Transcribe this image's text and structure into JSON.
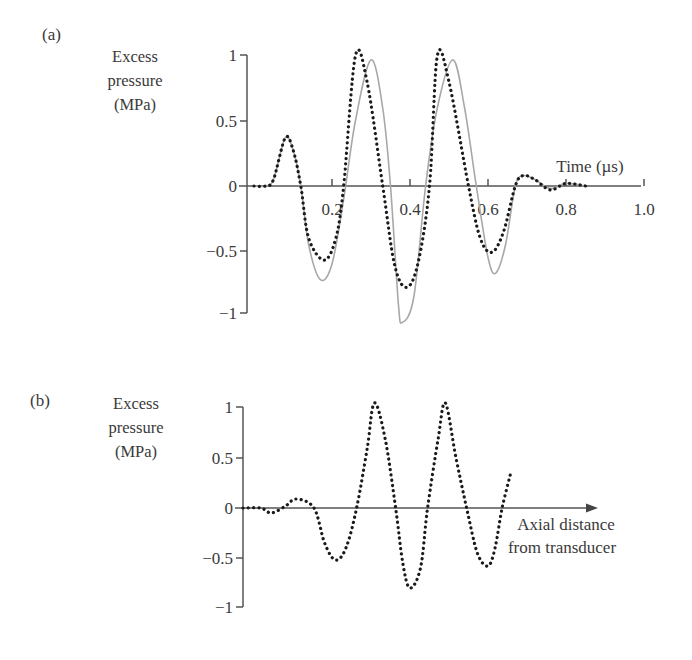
{
  "chart_data": [
    {
      "panel": "(a)",
      "type": "line",
      "ylabel": [
        "Excess",
        "pressure",
        "(MPa)"
      ],
      "xlabel": "Time (µs)",
      "xlim": [
        0,
        1.0
      ],
      "ylim": [
        -1,
        1
      ],
      "xticks": [
        0.2,
        0.4,
        0.6,
        0.8,
        1.0
      ],
      "xtick_labels": [
        "0.2",
        "0.4",
        "0.6",
        "0.8",
        "1.0"
      ],
      "yticks": [
        1,
        0.5,
        0,
        -0.5,
        -1
      ],
      "ytick_labels": [
        "1",
        "0.5",
        "0",
        "−0.5",
        "−1"
      ],
      "grid": false,
      "series": [
        {
          "name": "solid-gray",
          "style": "solid",
          "color": "#a8a8a8",
          "x": [
            0,
            0.03,
            0.05,
            0.08,
            0.1,
            0.12,
            0.14,
            0.17,
            0.2,
            0.23,
            0.26,
            0.3,
            0.33,
            0.35,
            0.37,
            0.38,
            0.41,
            0.44,
            0.47,
            0.51,
            0.54,
            0.57,
            0.6,
            0.62,
            0.645,
            0.67,
            0.69,
            0.72,
            0.76,
            0.8,
            0.85
          ],
          "y": [
            0,
            0,
            0.05,
            0.37,
            0.28,
            0,
            -0.45,
            -0.72,
            -0.6,
            -0.1,
            0.5,
            0.97,
            0.6,
            0,
            -0.9,
            -1.05,
            -0.85,
            0,
            0.6,
            0.97,
            0.6,
            0,
            -0.55,
            -0.67,
            -0.45,
            0,
            0.08,
            0.05,
            -0.02,
            0.02,
            0
          ]
        },
        {
          "name": "dotted-black",
          "style": "dotted",
          "color": "#1a1a1a",
          "x": [
            0,
            0.03,
            0.05,
            0.08,
            0.1,
            0.12,
            0.14,
            0.18,
            0.21,
            0.23,
            0.26,
            0.29,
            0.33,
            0.36,
            0.39,
            0.42,
            0.45,
            0.47,
            0.5,
            0.55,
            0.58,
            0.61,
            0.64,
            0.67,
            0.69,
            0.72,
            0.76,
            0.8,
            0.85
          ],
          "y": [
            0,
            0,
            0.05,
            0.37,
            0.28,
            0,
            -0.4,
            -0.57,
            -0.4,
            0,
            1.0,
            0.8,
            0,
            -0.6,
            -0.78,
            -0.6,
            0,
            1.0,
            0.8,
            0,
            -0.4,
            -0.51,
            -0.35,
            0,
            0.08,
            0.05,
            -0.03,
            0.02,
            0
          ]
        }
      ]
    },
    {
      "panel": "(b)",
      "type": "line",
      "ylabel": [
        "Excess",
        "pressure",
        "(MPa)"
      ],
      "xlabel": [
        "Axial distance",
        "from transducer"
      ],
      "xlim": [
        0,
        1.0
      ],
      "ylim": [
        -1,
        1
      ],
      "xticks": [],
      "yticks": [
        1,
        0.5,
        0,
        -0.5,
        -1
      ],
      "ytick_labels": [
        "1",
        "0.5",
        "0",
        "−0.5",
        "−1"
      ],
      "grid": false,
      "x_axis_arrow": true,
      "series": [
        {
          "name": "dotted-black",
          "style": "dotted",
          "color": "#1a1a1a",
          "x": [
            0,
            0.05,
            0.08,
            0.12,
            0.15,
            0.2,
            0.23,
            0.26,
            0.29,
            0.32,
            0.35,
            0.37,
            0.4,
            0.43,
            0.45,
            0.47,
            0.5,
            0.52,
            0.55,
            0.57,
            0.6,
            0.63,
            0.66,
            0.69,
            0.71,
            0.73,
            0.755
          ],
          "y": [
            0,
            0,
            -0.05,
            0.02,
            0.09,
            0,
            -0.35,
            -0.52,
            -0.4,
            0,
            0.6,
            1.05,
            0.7,
            0,
            -0.55,
            -0.8,
            -0.6,
            0,
            0.7,
            1.05,
            0.5,
            0,
            -0.45,
            -0.58,
            -0.4,
            0,
            0.36
          ]
        }
      ]
    }
  ]
}
